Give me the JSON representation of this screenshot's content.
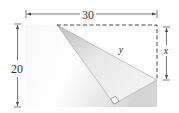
{
  "diagram": {
    "labels": {
      "width": "30",
      "height": "20",
      "x": "x",
      "y": "y"
    },
    "colors": {
      "line": "#444444",
      "dashed": "#333333",
      "paper_light": "#f7f7f7",
      "paper_dark": "#d8d8d8",
      "triangle_light": "#f2f2f2",
      "triangle_dark": "#c8c8c8"
    }
  }
}
